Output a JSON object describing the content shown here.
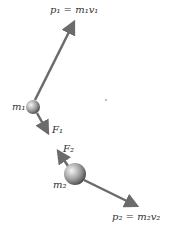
{
  "diagram": {
    "labels": {
      "p1": "p₁ = m₁v₁",
      "p2": "p₂ = m₂v₂",
      "m1": "m₁",
      "m2": "m₂",
      "F1": "F₁",
      "F2": "F₂"
    },
    "colors": {
      "arrow": "#6b6b6b",
      "ball_light": "#f2f2f2",
      "ball_dark": "#555555",
      "text": "#333333"
    }
  }
}
